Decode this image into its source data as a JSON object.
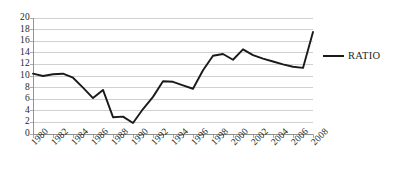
{
  "chart_data": {
    "type": "line",
    "title": "",
    "xlabel": "",
    "ylabel": "",
    "grid": true,
    "legend_position": "right",
    "xlim": [
      1980,
      2008
    ],
    "ylim": [
      0,
      20
    ],
    "y_ticks": [
      0,
      2,
      4,
      6,
      8,
      10,
      12,
      14,
      16,
      18,
      20
    ],
    "y_tick_labels": [
      "0",
      "2",
      "4",
      "6",
      "8",
      "10",
      "12",
      "14",
      "16",
      "18",
      "20"
    ],
    "x_ticks": [
      1980,
      1982,
      1984,
      1986,
      1988,
      1990,
      1992,
      1994,
      1996,
      1998,
      2000,
      2002,
      2004,
      2006,
      2008
    ],
    "x_tick_labels": [
      "1980",
      "1982",
      "1984",
      "1986",
      "1988",
      "1990",
      "1992",
      "1994",
      "1996",
      "1998",
      "2000",
      "2002",
      "2004",
      "2006",
      "2008"
    ],
    "x": [
      1980,
      1981,
      1982,
      1983,
      1984,
      1985,
      1986,
      1987,
      1988,
      1989,
      1990,
      1991,
      1992,
      1993,
      1994,
      1995,
      1996,
      1997,
      1998,
      1999,
      2000,
      2001,
      2002,
      2003,
      2004,
      2005,
      2006,
      2007,
      2008
    ],
    "series": [
      {
        "name": "RATIO",
        "color": "#1a1a1a",
        "values": [
          10.4,
          10.0,
          10.3,
          10.4,
          9.7,
          8.0,
          6.2,
          7.6,
          2.9,
          3.0,
          1.9,
          4.3,
          6.4,
          9.1,
          9.0,
          8.4,
          7.8,
          11.0,
          13.5,
          13.8,
          12.8,
          14.6,
          13.6,
          13.0,
          12.5,
          12.0,
          11.6,
          11.4,
          17.6
        ]
      }
    ]
  },
  "legend": {
    "entries": [
      {
        "label": "RATIO"
      }
    ]
  },
  "colors": {
    "series": "#1a1a1a",
    "grid": "#b0b0b0",
    "axis": "#8a8a8a",
    "text": "#262626",
    "background": "#ffffff"
  }
}
